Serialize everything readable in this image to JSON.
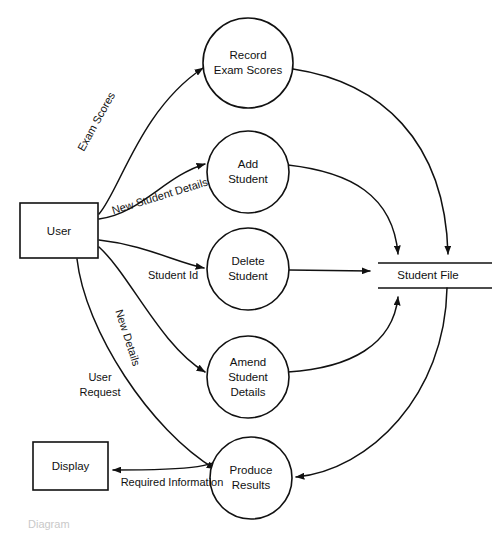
{
  "diagram": {
    "type": "data-flow-diagram",
    "caption": "Diagram",
    "colors": {
      "stroke": "#111111",
      "fill": "#ffffff",
      "background": "#ffffff"
    },
    "external_entities": [
      {
        "id": "user",
        "label": "User",
        "x": 20,
        "y": 203,
        "w": 78,
        "h": 55
      },
      {
        "id": "display",
        "label": "Display",
        "x": 33,
        "y": 442,
        "w": 75,
        "h": 48
      }
    ],
    "processes": [
      {
        "id": "p1",
        "label_lines": [
          "Record",
          "Exam Scores"
        ],
        "cx": 248,
        "cy": 63,
        "r": 45
      },
      {
        "id": "p2",
        "label_lines": [
          "Add",
          "Student"
        ],
        "cx": 248,
        "cy": 172,
        "r": 41
      },
      {
        "id": "p3",
        "label_lines": [
          "Delete",
          "Student"
        ],
        "cx": 248,
        "cy": 269,
        "r": 41
      },
      {
        "id": "p4",
        "label_lines": [
          "Amend",
          "Student",
          "Details"
        ],
        "cx": 248,
        "cy": 377,
        "r": 41
      },
      {
        "id": "p5",
        "label_lines": [
          "Produce",
          "Results"
        ],
        "cx": 251,
        "cy": 478,
        "r": 41
      }
    ],
    "data_stores": [
      {
        "id": "d1",
        "label": "Student File",
        "x1": 378,
        "y1": 263,
        "x2": 487,
        "y2": 287
      }
    ],
    "flows": [
      {
        "id": "f1",
        "label": "Exam Scores",
        "from": "user",
        "to": "p1",
        "label_x": 97,
        "label_y": 122,
        "rotate": -61
      },
      {
        "id": "f2",
        "label": "New Student Details",
        "from": "user",
        "to": "p2",
        "label_x": 160,
        "label_y": 197,
        "rotate": -17
      },
      {
        "id": "f3",
        "label": "Student Id",
        "from": "user",
        "to": "p3",
        "label_x": 173,
        "label_y": 276,
        "rotate": 0
      },
      {
        "id": "f4",
        "label": "New Details",
        "from": "user",
        "to": "p4",
        "label_x": 127,
        "label_y": 338,
        "rotate": 72
      },
      {
        "id": "f5",
        "label": "User Request",
        "from": "user",
        "to": "p5",
        "label_x": 100,
        "label_y": 384,
        "rotate": 0,
        "lines": [
          "User",
          "Request"
        ]
      },
      {
        "id": "f6",
        "label": "Required Information",
        "from": "p5",
        "to": "display",
        "label_x": 172,
        "label_y": 483,
        "rotate": 0
      },
      {
        "id": "f7",
        "label": "",
        "from": "p1",
        "to": "d1"
      },
      {
        "id": "f8",
        "label": "",
        "from": "p2",
        "to": "d1"
      },
      {
        "id": "f9",
        "label": "",
        "from": "p3",
        "to": "d1"
      },
      {
        "id": "f10",
        "label": "",
        "from": "p4",
        "to": "d1"
      },
      {
        "id": "f11",
        "label": "",
        "from": "d1",
        "to": "p5"
      }
    ]
  }
}
